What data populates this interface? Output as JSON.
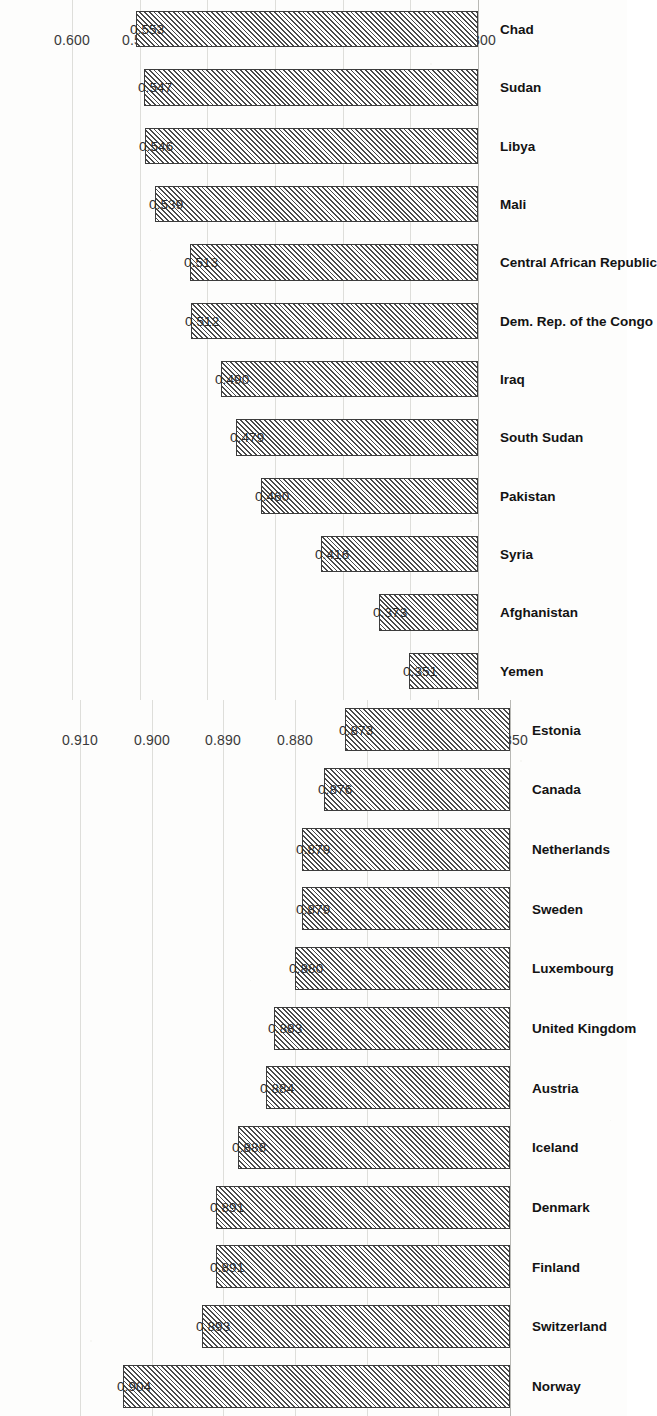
{
  "page": {
    "background_color": "#fdfdfc",
    "bar_fill_color": "#ffffff",
    "bar_edge_color": "#3c3c3c",
    "hatch_color": "#4a4a4a",
    "gridline_color": "#dededa",
    "orientation": "charts rotated 90 degrees counter-clockwise on the scanned page"
  },
  "chart_data": [
    {
      "id": "low-hdi",
      "type": "bar",
      "title": "",
      "subtitle": "",
      "xlabel": "",
      "ylabel": "",
      "orientation": "vertical-bars-rotated-90ccw",
      "grid": true,
      "legend": null,
      "ylim": [
        0.3,
        0.6
      ],
      "yticks": [
        "0.300",
        "0.350",
        "0.400",
        "0.450",
        "0.500",
        "0.550",
        "0.600"
      ],
      "ytick_values": [
        0.3,
        0.35,
        0.4,
        0.45,
        0.5,
        0.55,
        0.6
      ],
      "categories": [
        "Yemen",
        "Afghanistan",
        "Syria",
        "Pakistan",
        "South Sudan",
        "Iraq",
        "Dem. Rep. of the Congo",
        "Central African Republic",
        "Mali",
        "Libya",
        "Sudan",
        "Chad"
      ],
      "values": [
        0.351,
        0.373,
        0.416,
        0.46,
        0.479,
        0.49,
        0.512,
        0.513,
        0.539,
        0.546,
        0.547,
        0.553
      ],
      "value_labels": [
        "0.351",
        "0.373",
        "0.416",
        "0.460",
        "0.479",
        "0.490",
        "0.512",
        "0.513",
        "0.539",
        "0.546",
        "0.547",
        "0.553"
      ]
    },
    {
      "id": "high-hdi",
      "type": "bar",
      "title": "",
      "subtitle": "",
      "xlabel": "",
      "ylabel": "",
      "orientation": "vertical-bars-rotated-90ccw",
      "grid": true,
      "legend": null,
      "ylim": [
        0.85,
        0.91
      ],
      "yticks": [
        "0.850",
        "0.860",
        "0.870",
        "0.880",
        "0.890",
        "0.900",
        "0.910"
      ],
      "ytick_values": [
        0.85,
        0.86,
        0.87,
        0.88,
        0.89,
        0.9,
        0.91
      ],
      "categories": [
        "Norway",
        "Switzerland",
        "Finland",
        "Denmark",
        "Iceland",
        "Austria",
        "United Kingdom",
        "Luxembourg",
        "Sweden",
        "Netherlands",
        "Canada",
        "Estonia"
      ],
      "values": [
        0.904,
        0.893,
        0.891,
        0.891,
        0.888,
        0.884,
        0.883,
        0.88,
        0.879,
        0.879,
        0.876,
        0.873
      ],
      "value_labels": [
        "0.904",
        "0.893",
        "0.891",
        "0.891",
        "0.888",
        "0.884",
        "0.883",
        "0.880",
        "0.879",
        "0.879",
        "0.876",
        "0.873"
      ]
    }
  ]
}
